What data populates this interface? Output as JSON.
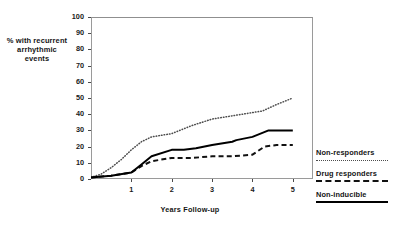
{
  "chart_data": {
    "type": "line",
    "title": "",
    "xlabel": "Years Follow-up",
    "ylabel": "% with recurrent arrhythmic events",
    "xlim": [
      0,
      5.5
    ],
    "ylim": [
      0,
      100
    ],
    "grid": false,
    "legend_position": "right",
    "xticks": [
      "1",
      "2",
      "3",
      "4",
      "5"
    ],
    "xtick_values": [
      1,
      2,
      3,
      4,
      5
    ],
    "yticks": [
      "0",
      "10",
      "20",
      "30",
      "40",
      "50",
      "60",
      "70",
      "80",
      "90",
      "100"
    ],
    "ytick_values": [
      0,
      10,
      20,
      30,
      40,
      50,
      60,
      70,
      80,
      90,
      100
    ],
    "series": [
      {
        "name": "Non-responders",
        "style": "dotted",
        "color": "#4d4d4d",
        "x": [
          0,
          0.25,
          0.5,
          0.75,
          1.0,
          1.25,
          1.5,
          2.0,
          2.5,
          3.0,
          3.5,
          4.0,
          4.25,
          4.6,
          5.0
        ],
        "values": [
          1,
          3,
          7,
          12,
          18,
          23,
          26,
          28,
          33,
          37,
          39,
          41,
          42,
          46,
          50
        ]
      },
      {
        "name": "Drug responders",
        "style": "dashed",
        "color": "#111111",
        "x": [
          0,
          0.5,
          1.0,
          1.25,
          1.5,
          2.0,
          2.5,
          3.0,
          3.5,
          4.0,
          4.3,
          4.6,
          5.0
        ],
        "values": [
          1,
          2,
          4,
          8,
          11,
          13,
          13,
          14,
          14,
          15,
          20,
          21,
          21
        ]
      },
      {
        "name": "Non-inducible",
        "style": "solid",
        "color": "#000000",
        "x": [
          0,
          0.5,
          1.0,
          1.25,
          1.5,
          2.0,
          2.3,
          2.6,
          3.0,
          3.5,
          3.6,
          4.0,
          4.4,
          4.7,
          5.0
        ],
        "values": [
          1,
          2,
          4,
          9,
          14,
          18,
          18,
          19,
          21,
          23,
          24,
          26,
          30,
          30,
          30
        ]
      }
    ]
  },
  "axis": {
    "ylabel_text": "% with recurrent arrhythmic events",
    "xlabel_text": "Years Follow-up"
  },
  "legend": {
    "entries": [
      {
        "label": "Non-responders",
        "style": "dotted"
      },
      {
        "label": "Drug responders",
        "style": "dashed"
      },
      {
        "label": "Non-inducible",
        "style": "solid"
      }
    ]
  }
}
